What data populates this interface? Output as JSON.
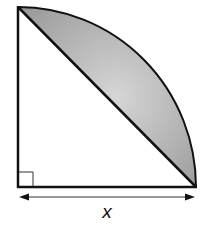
{
  "diagram": {
    "type": "quarter-circle-segment",
    "labels": {
      "base_length": "x"
    },
    "markers": {
      "right_angle": true,
      "dimension_arrow": "double-headed"
    },
    "colors": {
      "stroke": "#111111",
      "shade_light": "#d6d6d6",
      "shade_dark": "#9a9a9a",
      "background": "#ffffff"
    }
  }
}
